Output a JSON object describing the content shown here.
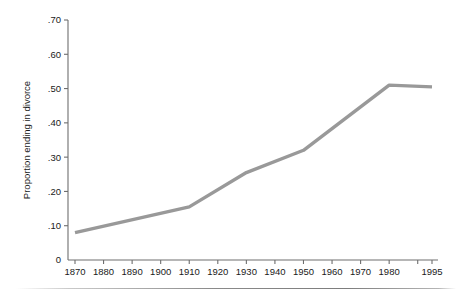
{
  "chart_data": {
    "type": "line",
    "title": "",
    "subtitle": "",
    "xlabel": "",
    "ylabel": "Proportion ending in divorce",
    "x": [
      1870,
      1910,
      1930,
      1950,
      1980,
      1995
    ],
    "values": [
      0.08,
      0.155,
      0.255,
      0.32,
      0.51,
      0.505
    ],
    "series": [
      {
        "name": "Proportion ending in divorce",
        "x": [
          1870,
          1910,
          1930,
          1950,
          1980,
          1995
        ],
        "values": [
          0.08,
          0.155,
          0.255,
          0.32,
          0.51,
          0.505
        ]
      }
    ],
    "xlim": [
      1870,
      1995
    ],
    "ylim": [
      0,
      0.7
    ],
    "grid": false,
    "legend": false,
    "legend_position": "none",
    "line_color": "#999999",
    "axis_color": "#6e6e6e",
    "text_color": "#1a1a1a",
    "background": "#ffffff",
    "xticks": [
      {
        "value": 1870,
        "label": "1870"
      },
      {
        "value": 1880,
        "label": "1880"
      },
      {
        "value": 1890,
        "label": "1890"
      },
      {
        "value": 1900,
        "label": "1900"
      },
      {
        "value": 1910,
        "label": "1910"
      },
      {
        "value": 1920,
        "label": "1920"
      },
      {
        "value": 1930,
        "label": "1930"
      },
      {
        "value": 1940,
        "label": "1940"
      },
      {
        "value": 1950,
        "label": "1950"
      },
      {
        "value": 1960,
        "label": "1960"
      },
      {
        "value": 1970,
        "label": "1970"
      },
      {
        "value": 1980,
        "label": "1980"
      },
      {
        "value": 1990,
        "label": ""
      },
      {
        "value": 1995,
        "label": "1995"
      }
    ],
    "yticks": [
      {
        "value": 0,
        "label": "0"
      },
      {
        "value": 0.1,
        "label": ".10"
      },
      {
        "value": 0.2,
        "label": ".20"
      },
      {
        "value": 0.3,
        "label": ".30"
      },
      {
        "value": 0.4,
        "label": ".40"
      },
      {
        "value": 0.5,
        "label": ".50"
      },
      {
        "value": 0.6,
        "label": ".60"
      },
      {
        "value": 0.7,
        "label": ".70"
      }
    ]
  }
}
